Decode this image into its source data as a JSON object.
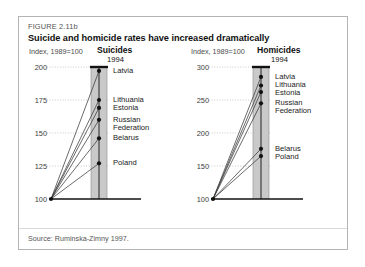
{
  "figure": {
    "number": "FIGURE 2.11b",
    "title": "Suicide and homicide rates have increased dramatically",
    "source": "Source: Ruminska-Zimny 1997."
  },
  "panels": {
    "suicides": {
      "index_note": "Index, 1989=100",
      "title": "Suicides",
      "year": "1994"
    },
    "homicides": {
      "index_note": "Index, 1989=100",
      "title": "Homicides",
      "year": "1994"
    }
  },
  "colors": {
    "band_fill": "#c9c9c9",
    "band_edge": "#8c8c8c",
    "line": "#3a3a3a",
    "point": "#111111",
    "axis": "#111111",
    "grid": "#bcbcbc",
    "frame": "#b4b4b4",
    "text": "#111111",
    "muted_text": "#555555"
  },
  "chart_data": [
    {
      "type": "line",
      "title": "Suicides",
      "subtitle": "1994",
      "ylabel": "Index, 1989=100",
      "xlabel": "",
      "x": [
        1989,
        1994
      ],
      "xtick_labels": [
        "",
        "1994"
      ],
      "ylim": [
        100,
        200
      ],
      "yticks": [
        100,
        125,
        150,
        175,
        200
      ],
      "ytick_labels": [
        "100",
        "125",
        "150",
        "175",
        "200"
      ],
      "grid": true,
      "legend": "inline-right-labels",
      "baseline_value": 100,
      "series": [
        {
          "name": "Latvia",
          "values": [
            100,
            197
          ]
        },
        {
          "name": "Lithuania",
          "values": [
            100,
            175
          ]
        },
        {
          "name": "Estonia",
          "values": [
            100,
            169
          ]
        },
        {
          "name": "Russian Federation",
          "values": [
            100,
            160
          ]
        },
        {
          "name": "Belarus",
          "values": [
            100,
            146
          ]
        },
        {
          "name": "Poland",
          "values": [
            100,
            127
          ]
        }
      ]
    },
    {
      "type": "line",
      "title": "Homicides",
      "subtitle": "1994",
      "ylabel": "Index, 1989=100",
      "xlabel": "",
      "x": [
        1989,
        1994
      ],
      "xtick_labels": [
        "",
        "1994"
      ],
      "ylim": [
        100,
        300
      ],
      "yticks": [
        100,
        150,
        200,
        250,
        300
      ],
      "ytick_labels": [
        "100",
        "150",
        "200",
        "250",
        "300"
      ],
      "grid": true,
      "legend": "inline-right-labels",
      "baseline_value": 100,
      "series": [
        {
          "name": "Latvia",
          "values": [
            100,
            285
          ]
        },
        {
          "name": "Lithuania",
          "values": [
            100,
            272
          ]
        },
        {
          "name": "Estonia",
          "values": [
            100,
            262
          ]
        },
        {
          "name": "Russian Federation",
          "values": [
            100,
            245
          ]
        },
        {
          "name": "Belarus",
          "values": [
            100,
            176
          ]
        },
        {
          "name": "Poland",
          "values": [
            100,
            165
          ]
        }
      ]
    }
  ],
  "country_label_blocks": {
    "suicides": [
      {
        "text": "Latvia",
        "value": 197
      },
      {
        "text": "Lithuania",
        "value": 175
      },
      {
        "text": "Estonia",
        "value": 169
      },
      {
        "text": "Russian",
        "value": 160
      },
      {
        "text": "Federation",
        "value": 160
      },
      {
        "text": "Belarus",
        "value": 146
      },
      {
        "text": "Poland",
        "value": 127
      }
    ],
    "homicides": [
      {
        "text": "Latvia",
        "value": 285
      },
      {
        "text": "Lithuania",
        "value": 272
      },
      {
        "text": "Estonia",
        "value": 262
      },
      {
        "text": "Russian",
        "value": 245
      },
      {
        "text": "Federation",
        "value": 245
      },
      {
        "text": "Belarus",
        "value": 176
      },
      {
        "text": "Poland",
        "value": 165
      }
    ]
  }
}
